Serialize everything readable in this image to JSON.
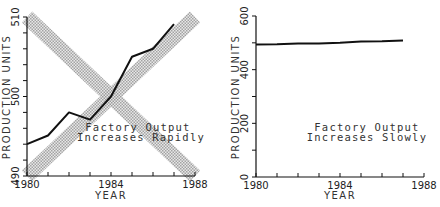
{
  "chart_data": [
    {
      "type": "line",
      "title": "",
      "annotation": [
        "Factory Output",
        "Increases Rapidly"
      ],
      "xlabel": "YEAR",
      "ylabel": "PRODUCTION UNITS",
      "xlim": [
        1980,
        1988
      ],
      "ylim": [
        490,
        510
      ],
      "x_ticks": [
        1980,
        1981,
        1982,
        1983,
        1984,
        1985,
        1986,
        1987,
        1988
      ],
      "x_tick_labels": [
        "1980",
        "1984",
        "1988"
      ],
      "x_tick_label_values": [
        1980,
        1984,
        1988
      ],
      "y_ticks": [
        490,
        492,
        494,
        496,
        498,
        500,
        502,
        504,
        506,
        508,
        510
      ],
      "y_tick_labels": [
        "490",
        "500",
        "510"
      ],
      "y_tick_label_values": [
        490,
        500,
        510
      ],
      "grid": false,
      "series": [
        {
          "name": "Production",
          "x": [
            1980,
            1981,
            1982,
            1983,
            1984,
            1985,
            1986,
            1987
          ],
          "y": [
            494.0,
            495.1,
            498.0,
            497.1,
            500.0,
            505.0,
            506.0,
            509.1
          ]
        }
      ],
      "overlay_bands": [
        {
          "name": "rising-band",
          "from": [
            1980,
            490
          ],
          "to": [
            1988,
            510
          ]
        },
        {
          "name": "falling-band",
          "from": [
            1980,
            510
          ],
          "to": [
            1988,
            490
          ]
        }
      ]
    },
    {
      "type": "line",
      "title": "",
      "annotation": [
        "Factory Output",
        "Increases Slowly"
      ],
      "xlabel": "YEAR",
      "ylabel": "PRODUCTION UNITS",
      "xlim": [
        1980,
        1988
      ],
      "ylim": [
        0,
        600
      ],
      "x_ticks": [
        1980,
        1981,
        1982,
        1983,
        1984,
        1985,
        1986,
        1987,
        1988
      ],
      "x_tick_labels": [
        "1980",
        "1984",
        "1988"
      ],
      "x_tick_label_values": [
        1980,
        1984,
        1988
      ],
      "y_ticks": [
        0,
        100,
        200,
        300,
        400,
        500,
        600
      ],
      "y_tick_labels": [
        "0",
        "200",
        "400",
        "600"
      ],
      "y_tick_label_values": [
        0,
        200,
        400,
        600
      ],
      "grid": false,
      "series": [
        {
          "name": "Production",
          "x": [
            1980,
            1981,
            1982,
            1983,
            1984,
            1985,
            1986,
            1987
          ],
          "y": [
            494,
            495,
            498,
            497,
            500,
            505,
            506,
            509
          ]
        }
      ]
    }
  ]
}
